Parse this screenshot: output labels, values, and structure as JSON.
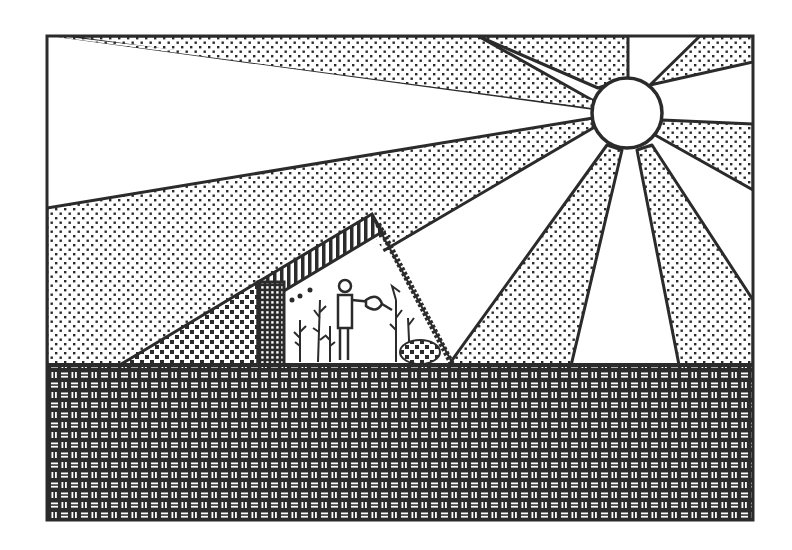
{
  "illustration": {
    "subject": "Solar greenhouse clip art",
    "description": "Monochrome illustration of a sun radiating rays onto a lean-to greenhouse where a person waters plants, above a woven-pattern ground",
    "colors": {
      "ink": "#2b2b2b",
      "paper": "#ffffff"
    },
    "frame": {
      "x": 47,
      "y": 36,
      "width": 706,
      "height": 484
    },
    "sun": {
      "cx": 627,
      "cy": 113,
      "r": 35
    },
    "ground_top_y": 365,
    "greenhouse": {
      "back_wall": {
        "x": 258,
        "y": 282,
        "width": 24,
        "height": 83
      },
      "roof_peak": {
        "x": 372,
        "y": 215
      },
      "glass_bottom": {
        "x": 452,
        "y": 362
      },
      "berm_start": {
        "x": 120,
        "y": 365
      }
    },
    "figures": [
      "person-watering",
      "plants"
    ]
  }
}
